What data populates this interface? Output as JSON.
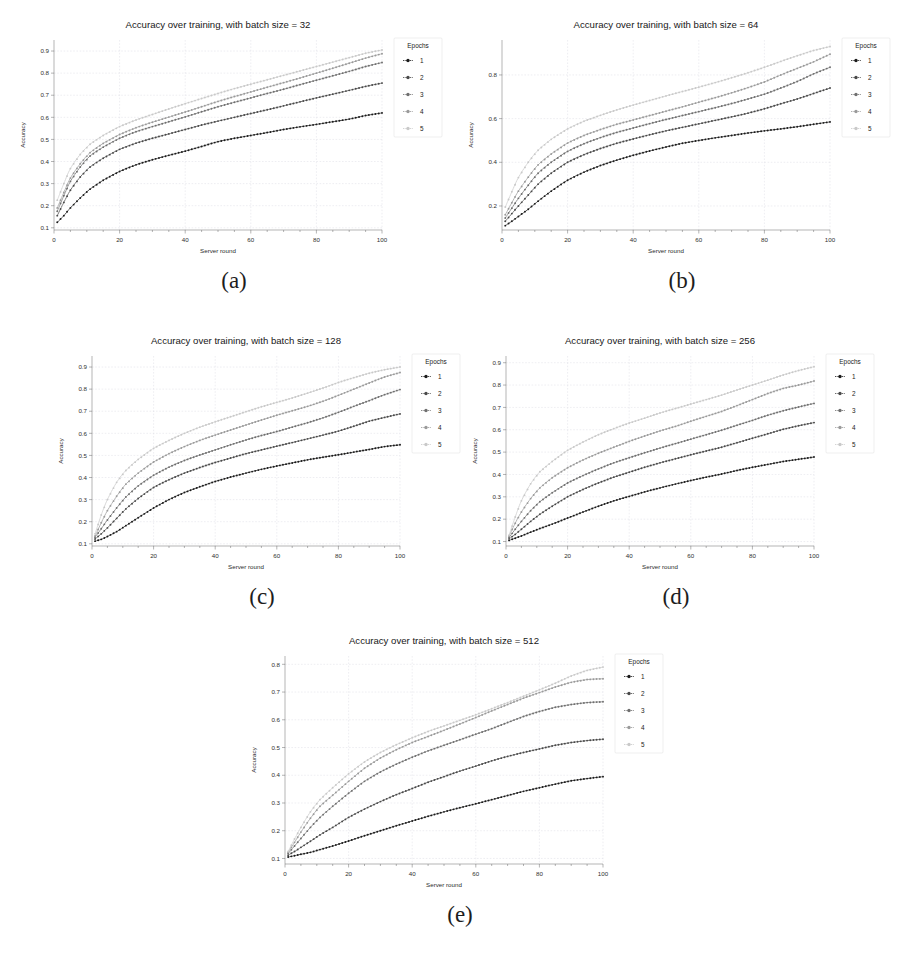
{
  "figure": {
    "layout": "five-panel-grid",
    "background": "#ffffff",
    "subfigure_labels": [
      "(a)",
      "(b)",
      "(c)",
      "(d)",
      "(e)"
    ]
  },
  "common": {
    "xlabel": "Server round",
    "ylabel": "Accuracy",
    "legend_title": "Epochs",
    "legend_entries": [
      "1",
      "2",
      "3",
      "4",
      "5"
    ],
    "xticks": [
      0,
      20,
      40,
      60,
      80,
      100
    ],
    "xlim": [
      0,
      100
    ],
    "series_colors": [
      "#1b1b1b",
      "#494949",
      "#6f6f6f",
      "#9a9a9a",
      "#c9c9c9"
    ],
    "marker": "plus-dot-marker"
  },
  "chart_data": [
    {
      "id": "a",
      "type": "line",
      "title": "Accuracy over training, with batch size = 32",
      "xlabel": "Server round",
      "ylabel": "Accuracy",
      "xlim": [
        0,
        100
      ],
      "ylim": [
        0.09,
        0.95
      ],
      "xticks": [
        0,
        20,
        40,
        60,
        80,
        100
      ],
      "yticks": [
        0.1,
        0.2,
        0.3,
        0.4,
        0.5,
        0.6,
        0.7,
        0.8,
        0.9
      ],
      "grid": true,
      "legend_position": "right",
      "legend_title": "Epochs",
      "x": [
        1,
        3,
        5,
        8,
        11,
        15,
        20,
        25,
        30,
        35,
        40,
        45,
        50,
        55,
        60,
        65,
        70,
        75,
        80,
        85,
        90,
        95,
        100
      ],
      "series": [
        {
          "name": "1",
          "values": [
            0.125,
            0.155,
            0.19,
            0.235,
            0.275,
            0.315,
            0.355,
            0.385,
            0.408,
            0.428,
            0.447,
            0.468,
            0.49,
            0.505,
            0.518,
            0.531,
            0.545,
            0.557,
            0.568,
            0.58,
            0.592,
            0.608,
            0.62
          ]
        },
        {
          "name": "2",
          "values": [
            0.155,
            0.215,
            0.27,
            0.33,
            0.375,
            0.415,
            0.455,
            0.483,
            0.505,
            0.525,
            0.545,
            0.565,
            0.583,
            0.6,
            0.617,
            0.634,
            0.652,
            0.67,
            0.688,
            0.705,
            0.722,
            0.74,
            0.755
          ]
        },
        {
          "name": "3",
          "values": [
            0.175,
            0.245,
            0.31,
            0.375,
            0.425,
            0.465,
            0.505,
            0.535,
            0.558,
            0.58,
            0.602,
            0.625,
            0.648,
            0.668,
            0.688,
            0.708,
            0.727,
            0.748,
            0.768,
            0.788,
            0.808,
            0.83,
            0.848
          ]
        },
        {
          "name": "4",
          "values": [
            0.19,
            0.26,
            0.325,
            0.39,
            0.44,
            0.482,
            0.522,
            0.553,
            0.578,
            0.601,
            0.624,
            0.648,
            0.672,
            0.694,
            0.715,
            0.736,
            0.757,
            0.778,
            0.8,
            0.822,
            0.845,
            0.868,
            0.888
          ]
        },
        {
          "name": "5",
          "values": [
            0.225,
            0.3,
            0.368,
            0.432,
            0.478,
            0.518,
            0.558,
            0.588,
            0.613,
            0.638,
            0.662,
            0.685,
            0.708,
            0.73,
            0.75,
            0.77,
            0.79,
            0.81,
            0.83,
            0.85,
            0.87,
            0.89,
            0.905
          ]
        }
      ]
    },
    {
      "id": "b",
      "type": "line",
      "title": "Accuracy over training, with batch size = 64",
      "xlabel": "Server round",
      "ylabel": "Accuracy",
      "xlim": [
        0,
        100
      ],
      "ylim": [
        0.09,
        0.96
      ],
      "xticks": [
        0,
        20,
        40,
        60,
        80,
        100
      ],
      "yticks": [
        0.2,
        0.4,
        0.6,
        0.8
      ],
      "grid": true,
      "legend_position": "right",
      "legend_title": "Epochs",
      "x": [
        1,
        3,
        5,
        8,
        11,
        15,
        20,
        25,
        30,
        35,
        40,
        45,
        50,
        55,
        60,
        65,
        70,
        75,
        80,
        85,
        90,
        95,
        100
      ],
      "series": [
        {
          "name": "1",
          "values": [
            0.11,
            0.13,
            0.152,
            0.185,
            0.222,
            0.268,
            0.318,
            0.355,
            0.385,
            0.41,
            0.432,
            0.452,
            0.47,
            0.487,
            0.5,
            0.512,
            0.523,
            0.534,
            0.544,
            0.553,
            0.563,
            0.574,
            0.585
          ]
        },
        {
          "name": "2",
          "values": [
            0.13,
            0.165,
            0.2,
            0.25,
            0.3,
            0.35,
            0.4,
            0.435,
            0.463,
            0.487,
            0.507,
            0.526,
            0.544,
            0.56,
            0.576,
            0.592,
            0.608,
            0.625,
            0.645,
            0.668,
            0.69,
            0.715,
            0.74
          ]
        },
        {
          "name": "3",
          "values": [
            0.145,
            0.19,
            0.235,
            0.295,
            0.35,
            0.4,
            0.45,
            0.485,
            0.513,
            0.537,
            0.557,
            0.577,
            0.596,
            0.614,
            0.632,
            0.65,
            0.669,
            0.69,
            0.712,
            0.74,
            0.77,
            0.805,
            0.835
          ]
        },
        {
          "name": "4",
          "values": [
            0.16,
            0.215,
            0.268,
            0.332,
            0.388,
            0.438,
            0.488,
            0.523,
            0.55,
            0.574,
            0.594,
            0.614,
            0.634,
            0.654,
            0.675,
            0.696,
            0.718,
            0.742,
            0.768,
            0.8,
            0.83,
            0.86,
            0.895
          ]
        },
        {
          "name": "5",
          "values": [
            0.195,
            0.265,
            0.33,
            0.4,
            0.455,
            0.505,
            0.553,
            0.588,
            0.615,
            0.64,
            0.662,
            0.683,
            0.704,
            0.724,
            0.744,
            0.765,
            0.787,
            0.81,
            0.835,
            0.862,
            0.888,
            0.912,
            0.93
          ]
        }
      ]
    },
    {
      "id": "c",
      "type": "line",
      "title": "Accuracy over training, with batch size = 128",
      "xlabel": "Server round",
      "ylabel": "Accuracy",
      "xlim": [
        0,
        100
      ],
      "ylim": [
        0.09,
        0.95
      ],
      "xticks": [
        0,
        20,
        40,
        60,
        80,
        100
      ],
      "yticks": [
        0.1,
        0.2,
        0.3,
        0.4,
        0.5,
        0.6,
        0.7,
        0.8,
        0.9
      ],
      "grid": true,
      "legend_position": "right",
      "legend_title": "Epochs",
      "x": [
        1,
        3,
        5,
        8,
        11,
        15,
        20,
        25,
        30,
        35,
        40,
        45,
        50,
        55,
        60,
        65,
        70,
        75,
        80,
        85,
        90,
        95,
        100
      ],
      "series": [
        {
          "name": "1",
          "values": [
            0.112,
            0.12,
            0.133,
            0.155,
            0.182,
            0.218,
            0.262,
            0.3,
            0.332,
            0.358,
            0.382,
            0.402,
            0.42,
            0.437,
            0.452,
            0.466,
            0.48,
            0.492,
            0.503,
            0.515,
            0.527,
            0.54,
            0.548
          ]
        },
        {
          "name": "2",
          "values": [
            0.122,
            0.145,
            0.172,
            0.215,
            0.258,
            0.305,
            0.355,
            0.39,
            0.42,
            0.445,
            0.468,
            0.488,
            0.508,
            0.525,
            0.542,
            0.558,
            0.575,
            0.592,
            0.61,
            0.632,
            0.655,
            0.672,
            0.688
          ]
        },
        {
          "name": "3",
          "values": [
            0.13,
            0.168,
            0.208,
            0.262,
            0.312,
            0.362,
            0.41,
            0.447,
            0.477,
            0.502,
            0.525,
            0.548,
            0.57,
            0.59,
            0.608,
            0.628,
            0.648,
            0.67,
            0.695,
            0.722,
            0.748,
            0.775,
            0.798
          ]
        },
        {
          "name": "4",
          "values": [
            0.135,
            0.195,
            0.25,
            0.315,
            0.37,
            0.42,
            0.47,
            0.508,
            0.54,
            0.568,
            0.592,
            0.615,
            0.638,
            0.66,
            0.682,
            0.702,
            0.722,
            0.745,
            0.772,
            0.8,
            0.828,
            0.855,
            0.875
          ]
        },
        {
          "name": "5",
          "values": [
            0.145,
            0.23,
            0.3,
            0.378,
            0.432,
            0.482,
            0.532,
            0.568,
            0.6,
            0.628,
            0.652,
            0.675,
            0.698,
            0.72,
            0.74,
            0.76,
            0.782,
            0.805,
            0.83,
            0.852,
            0.872,
            0.888,
            0.9
          ]
        }
      ]
    },
    {
      "id": "d",
      "type": "line",
      "title": "Accuracy over training, with batch size = 256",
      "xlabel": "Server round",
      "ylabel": "Accuracy",
      "xlim": [
        0,
        100
      ],
      "ylim": [
        0.08,
        0.93
      ],
      "xticks": [
        0,
        20,
        40,
        60,
        80,
        100
      ],
      "yticks": [
        0.1,
        0.2,
        0.3,
        0.4,
        0.5,
        0.6,
        0.7,
        0.8,
        0.9
      ],
      "grid": true,
      "legend_position": "right",
      "legend_title": "Epochs",
      "x": [
        1,
        3,
        5,
        8,
        11,
        15,
        20,
        25,
        30,
        35,
        40,
        45,
        50,
        55,
        60,
        65,
        70,
        75,
        80,
        85,
        90,
        95,
        100
      ],
      "series": [
        {
          "name": "1",
          "values": [
            0.105,
            0.115,
            0.125,
            0.142,
            0.158,
            0.178,
            0.205,
            0.232,
            0.258,
            0.282,
            0.302,
            0.322,
            0.34,
            0.357,
            0.373,
            0.388,
            0.402,
            0.418,
            0.432,
            0.445,
            0.458,
            0.468,
            0.478
          ]
        },
        {
          "name": "2",
          "values": [
            0.112,
            0.132,
            0.155,
            0.19,
            0.222,
            0.258,
            0.3,
            0.333,
            0.362,
            0.388,
            0.41,
            0.432,
            0.452,
            0.47,
            0.488,
            0.505,
            0.522,
            0.542,
            0.562,
            0.582,
            0.602,
            0.618,
            0.632
          ]
        },
        {
          "name": "3",
          "values": [
            0.118,
            0.155,
            0.19,
            0.238,
            0.278,
            0.318,
            0.362,
            0.395,
            0.425,
            0.452,
            0.475,
            0.497,
            0.518,
            0.538,
            0.558,
            0.578,
            0.598,
            0.62,
            0.642,
            0.665,
            0.685,
            0.702,
            0.718
          ]
        },
        {
          "name": "4",
          "values": [
            0.125,
            0.182,
            0.232,
            0.292,
            0.34,
            0.385,
            0.43,
            0.465,
            0.495,
            0.522,
            0.548,
            0.572,
            0.595,
            0.615,
            0.638,
            0.66,
            0.682,
            0.708,
            0.735,
            0.762,
            0.785,
            0.8,
            0.818
          ]
        },
        {
          "name": "5",
          "values": [
            0.128,
            0.21,
            0.282,
            0.358,
            0.412,
            0.458,
            0.508,
            0.545,
            0.578,
            0.605,
            0.63,
            0.652,
            0.675,
            0.695,
            0.715,
            0.735,
            0.755,
            0.778,
            0.8,
            0.822,
            0.845,
            0.865,
            0.882
          ]
        }
      ]
    },
    {
      "id": "e",
      "type": "line",
      "title": "Accuracy over training, with batch size = 512",
      "xlabel": "Server round",
      "ylabel": "Accuracy",
      "xlim": [
        0,
        100
      ],
      "ylim": [
        0.08,
        0.83
      ],
      "xticks": [
        0,
        20,
        40,
        60,
        80,
        100
      ],
      "yticks": [
        0.1,
        0.2,
        0.3,
        0.4,
        0.5,
        0.6,
        0.7,
        0.8
      ],
      "grid": true,
      "legend_position": "right",
      "legend_title": "Epochs",
      "x": [
        1,
        3,
        5,
        8,
        11,
        15,
        20,
        25,
        30,
        35,
        40,
        45,
        50,
        55,
        60,
        65,
        70,
        75,
        80,
        85,
        90,
        95,
        100
      ],
      "series": [
        {
          "name": "1",
          "values": [
            0.105,
            0.11,
            0.115,
            0.122,
            0.132,
            0.145,
            0.163,
            0.182,
            0.2,
            0.218,
            0.235,
            0.252,
            0.268,
            0.283,
            0.297,
            0.312,
            0.327,
            0.342,
            0.355,
            0.368,
            0.38,
            0.388,
            0.395
          ]
        },
        {
          "name": "2",
          "values": [
            0.112,
            0.125,
            0.14,
            0.162,
            0.185,
            0.212,
            0.248,
            0.278,
            0.305,
            0.33,
            0.352,
            0.375,
            0.395,
            0.415,
            0.433,
            0.452,
            0.468,
            0.482,
            0.495,
            0.508,
            0.518,
            0.525,
            0.53
          ]
        },
        {
          "name": "3",
          "values": [
            0.118,
            0.145,
            0.172,
            0.212,
            0.248,
            0.288,
            0.335,
            0.378,
            0.412,
            0.44,
            0.465,
            0.488,
            0.508,
            0.528,
            0.548,
            0.568,
            0.59,
            0.612,
            0.63,
            0.645,
            0.655,
            0.662,
            0.665
          ]
        },
        {
          "name": "4",
          "values": [
            0.122,
            0.158,
            0.195,
            0.245,
            0.288,
            0.328,
            0.378,
            0.425,
            0.462,
            0.492,
            0.518,
            0.54,
            0.562,
            0.585,
            0.608,
            0.632,
            0.655,
            0.678,
            0.698,
            0.718,
            0.735,
            0.745,
            0.748
          ]
        },
        {
          "name": "5",
          "values": [
            0.125,
            0.17,
            0.212,
            0.268,
            0.312,
            0.355,
            0.405,
            0.448,
            0.482,
            0.51,
            0.535,
            0.558,
            0.578,
            0.598,
            0.618,
            0.64,
            0.662,
            0.685,
            0.708,
            0.732,
            0.758,
            0.778,
            0.79
          ]
        }
      ]
    }
  ]
}
